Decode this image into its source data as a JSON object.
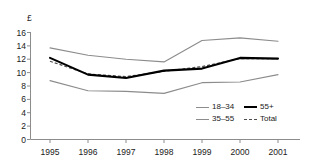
{
  "chart_data": {
    "type": "line",
    "title": "",
    "xlabel": "",
    "ylabel": "£",
    "categories": [
      "1995",
      "1996",
      "1997",
      "1998",
      "1999",
      "2000",
      "2001"
    ],
    "x": [
      1995,
      1996,
      1997,
      1998,
      1999,
      2000,
      2001
    ],
    "ylim": [
      0,
      16
    ],
    "yticks": [
      0,
      2,
      4,
      6,
      8,
      10,
      12,
      14,
      16
    ],
    "ytick_labels": [
      "0",
      "2",
      "4",
      "6",
      "8",
      "10",
      "12",
      "14",
      "16"
    ],
    "grid": false,
    "legend_position": "inside-lower-right",
    "series": [
      {
        "name": "18–34",
        "style": "thin-solid",
        "color": "#8c8c8c",
        "values": [
          8.8,
          7.3,
          7.2,
          6.9,
          8.5,
          8.6,
          9.7
        ]
      },
      {
        "name": "35–55",
        "style": "thin-solid",
        "color": "#8c8c8c",
        "values": [
          13.7,
          12.6,
          12.0,
          11.6,
          14.8,
          15.2,
          14.7
        ]
      },
      {
        "name": "55+",
        "style": "thick-solid",
        "color": "#000000",
        "values": [
          12.2,
          9.7,
          9.2,
          10.3,
          10.6,
          12.2,
          12.1
        ]
      },
      {
        "name": "Total",
        "style": "dashed",
        "color": "#4d4d4d",
        "values": [
          11.7,
          9.8,
          9.4,
          10.2,
          10.9,
          12.1,
          12.1
        ]
      }
    ]
  },
  "axes": {
    "currency_symbol": "£",
    "axis_color": "#8c8c8c"
  },
  "legend": {
    "entries": [
      {
        "label": "18–34",
        "swatch": "thin-solid"
      },
      {
        "label": "55+",
        "swatch": "thick-solid"
      },
      {
        "label": "35–55",
        "swatch": "thin-solid"
      },
      {
        "label": "Total",
        "swatch": "dashed"
      }
    ]
  }
}
